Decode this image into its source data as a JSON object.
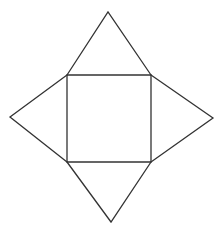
{
  "diagram": {
    "stroke_color": "#333333",
    "background": "#ffffff",
    "square": [
      [
        67,
        75
      ],
      [
        151,
        75
      ],
      [
        151,
        162
      ],
      [
        67,
        162
      ]
    ],
    "triangles": {
      "top": [
        [
          67,
          75
        ],
        [
          108,
          12
        ],
        [
          151,
          75
        ]
      ],
      "right": [
        [
          151,
          75
        ],
        [
          213,
          118
        ],
        [
          151,
          162
        ]
      ],
      "bottom": [
        [
          67,
          162
        ],
        [
          111,
          222
        ],
        [
          151,
          162
        ]
      ],
      "left": [
        [
          67,
          75
        ],
        [
          10,
          117
        ],
        [
          67,
          162
        ]
      ]
    }
  }
}
